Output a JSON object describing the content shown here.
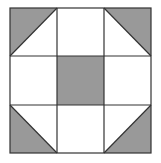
{
  "diagram": {
    "type": "quilt-block",
    "grid": {
      "rows": 3,
      "cols": 3
    },
    "colors": {
      "fill": "#999999",
      "line": "#333333",
      "background": "#ffffff"
    },
    "cells": [
      {
        "row": 0,
        "col": 0,
        "content": "half-square-triangle",
        "shaded": "upper-left"
      },
      {
        "row": 0,
        "col": 1,
        "content": "plain"
      },
      {
        "row": 0,
        "col": 2,
        "content": "half-square-triangle",
        "shaded": "upper-right"
      },
      {
        "row": 1,
        "col": 0,
        "content": "plain"
      },
      {
        "row": 1,
        "col": 1,
        "content": "shaded-square"
      },
      {
        "row": 1,
        "col": 2,
        "content": "plain"
      },
      {
        "row": 2,
        "col": 0,
        "content": "half-square-triangle",
        "shaded": "lower-left"
      },
      {
        "row": 2,
        "col": 1,
        "content": "plain"
      },
      {
        "row": 2,
        "col": 2,
        "content": "half-square-triangle",
        "shaded": "lower-right"
      }
    ]
  }
}
